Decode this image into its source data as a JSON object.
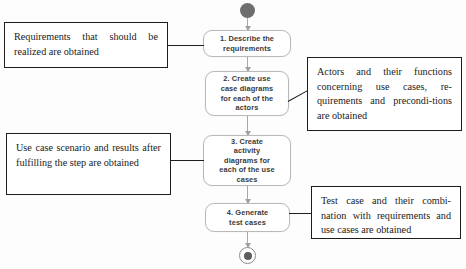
{
  "diagram": {
    "type": "uml-activity-diagram",
    "title": "",
    "start_marker": "initial-node",
    "end_marker": "final-node",
    "nodes": [
      {
        "id": "1",
        "label": "1. Describe the\nrequirements"
      },
      {
        "id": "2",
        "label": "2. Create use\ncase diagrams\nfor each of the\nactors"
      },
      {
        "id": "3",
        "label": "3. Create\nactivity\ndiagrams for\neach of the use\ncases"
      },
      {
        "id": "4",
        "label": "4. Generate\ntest cases"
      }
    ],
    "notes": [
      {
        "id": "note-1",
        "side": "left",
        "attached_to": "1",
        "text": "Requirements that should be realized are obtained"
      },
      {
        "id": "note-2",
        "side": "left",
        "attached_to": "3",
        "text": "Use case scenario and results after fulfilling the step are obtained"
      },
      {
        "id": "note-3",
        "side": "right",
        "attached_to": "2",
        "text": "Actors and their functions concerning use cases, re-​quirements and precondi-​tions are obtained"
      },
      {
        "id": "note-4",
        "side": "right",
        "attached_to": "4",
        "text": "Test case and their combi-​nation with requirements and use cases are obtained"
      }
    ],
    "flows": [
      {
        "from": "start",
        "to": "1"
      },
      {
        "from": "1",
        "to": "2"
      },
      {
        "from": "2",
        "to": "3"
      },
      {
        "from": "3",
        "to": "4"
      },
      {
        "from": "4",
        "to": "end"
      }
    ],
    "colors": {
      "node_border": "#b9b9b9",
      "node_fill": "#ffffff",
      "node_text": "#3a3a3a",
      "note_border": "#1d1d1d",
      "note_text": "#1b1b1b",
      "flow_line": "#a8a8a8",
      "start_fill": "#6e6e6e",
      "end_fill": "#5d5d5d",
      "background": "#fdfdfd"
    }
  }
}
